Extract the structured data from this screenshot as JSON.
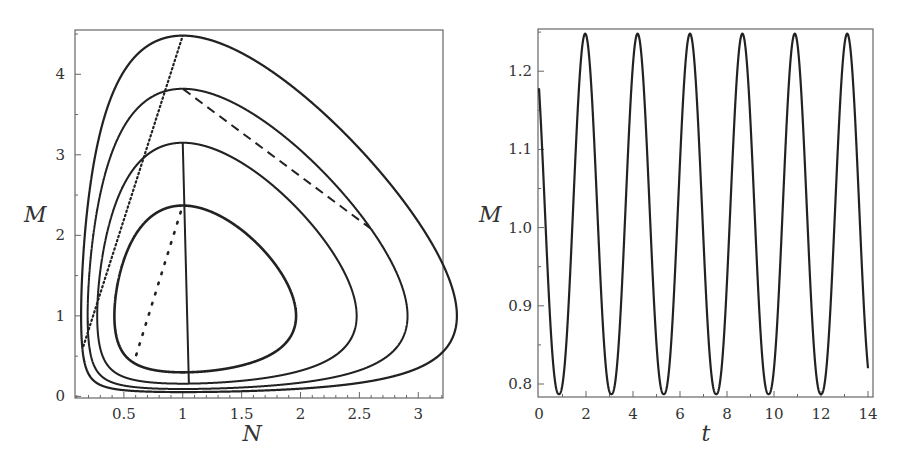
{
  "chart_data": [
    {
      "type": "line",
      "title": "",
      "xlabel": "N",
      "ylabel": "M",
      "xlim": [
        0.085,
        3.21
      ],
      "ylim": [
        -0.02,
        4.55
      ],
      "xticks": [
        "0.5",
        "1",
        "1.5",
        "2",
        "2.5",
        "3"
      ],
      "xtick_values": [
        0.5,
        1,
        1.5,
        2,
        2.5,
        3
      ],
      "yticks": [
        "0",
        "1",
        "2",
        "3",
        "4"
      ],
      "ytick_values": [
        0,
        1,
        2,
        3,
        4
      ],
      "grid": false,
      "legend": null,
      "series": [
        {
          "name": "orbit-inner",
          "style": "sparse-dotted",
          "N_range": [
            0.41,
            1.86
          ],
          "M_range": [
            0.32,
            2.37
          ]
        },
        {
          "name": "orbit-solid",
          "style": "solid",
          "N_range": [
            0.26,
            2.35
          ],
          "M_range": [
            0.17,
            3.15
          ]
        },
        {
          "name": "orbit-dashed",
          "style": "dashed",
          "N_range": [
            0.18,
            2.77
          ],
          "M_range": [
            0.1,
            3.82
          ]
        },
        {
          "name": "orbit-outer",
          "style": "dense-dotted",
          "N_range": [
            0.11,
            3.16
          ],
          "M_range": [
            0.05,
            4.48
          ]
        }
      ]
    },
    {
      "type": "line",
      "title": "",
      "xlabel": "t",
      "ylabel": "M",
      "xlim": [
        0,
        14.3
      ],
      "ylim": [
        0.785,
        1.255
      ],
      "xticks": [
        "0",
        "2",
        "4",
        "6",
        "8",
        "10",
        "12",
        "14"
      ],
      "xtick_values": [
        0,
        2,
        4,
        6,
        8,
        10,
        12,
        14
      ],
      "yticks": [
        "0.8",
        "0.9",
        "1.0",
        "1.1",
        "1.2"
      ],
      "ytick_values": [
        0.8,
        0.9,
        1.0,
        1.1,
        1.2
      ],
      "grid": false,
      "legend": null,
      "series": [
        {
          "name": "M(t)",
          "style": "solid",
          "start": {
            "t": 0,
            "M": 1.2
          },
          "end": {
            "t": 14,
            "M": 0.835
          },
          "peaks_t": [
            1.96,
            4.2,
            6.45,
            8.7,
            10.9,
            13.1
          ],
          "peak_M": 1.248,
          "troughs_t": [
            0.85,
            3.05,
            5.3,
            7.55,
            9.75,
            12.0
          ],
          "trough_M": 0.787,
          "period": 2.23
        }
      ]
    }
  ]
}
